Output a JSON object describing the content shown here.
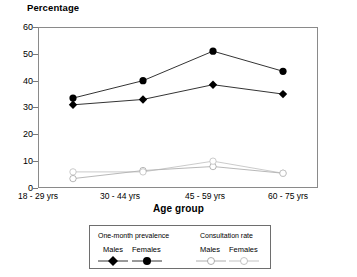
{
  "chart_data": {
    "type": "line",
    "title": "Percentage",
    "ylabel": "Percentage",
    "xlabel": "Age group",
    "categories": [
      "18 - 29 yrs",
      "30 - 44 yrs",
      "45 - 59 yrs",
      "60 - 75 yrs"
    ],
    "ylim": [
      0,
      60
    ],
    "yticks": [
      0,
      10,
      20,
      30,
      40,
      50,
      60
    ],
    "grid": false,
    "legend_position": "below-axis",
    "series": [
      {
        "name": "One-month prevalence Males",
        "group": "One-month prevalence",
        "sex": "Males",
        "marker": "filled-diamond",
        "color": "#000000",
        "values": [
          31,
          33,
          38.5,
          35
        ]
      },
      {
        "name": "One-month prevalence Females",
        "group": "One-month prevalence",
        "sex": "Females",
        "marker": "filled-circle",
        "color": "#000000",
        "values": [
          33.5,
          40,
          51,
          43.5
        ]
      },
      {
        "name": "Consultation rate Males",
        "group": "Consultation rate",
        "sex": "Males",
        "marker": "open-circle",
        "color": "#9a9a9a",
        "values": [
          3.5,
          6.5,
          8,
          5.5
        ]
      },
      {
        "name": "Consultation rate Females",
        "group": "Consultation rate",
        "sex": "Females",
        "marker": "open-circle",
        "color": "#b4b4b4",
        "values": [
          6,
          6,
          10,
          5.5
        ]
      }
    ]
  },
  "legend": {
    "groups": [
      {
        "title": "One-month prevalence",
        "items": [
          {
            "label": "Males",
            "marker": "filled-diamond"
          },
          {
            "label": "Females",
            "marker": "filled-circle"
          }
        ]
      },
      {
        "title": "Consultation rate",
        "items": [
          {
            "label": "Males",
            "marker": "open-circle-faint"
          },
          {
            "label": "Females",
            "marker": "open-circle-faint"
          }
        ]
      }
    ]
  },
  "axis": {
    "y_title": "Percentage",
    "x_title": "Age group",
    "y_ticks": [
      "60",
      "50",
      "40",
      "30",
      "20",
      "10",
      "0"
    ],
    "x_ticks": [
      "18 - 29 yrs",
      "30 - 44 yrs",
      "45 - 59 yrs",
      "60 - 75 yrs"
    ]
  }
}
